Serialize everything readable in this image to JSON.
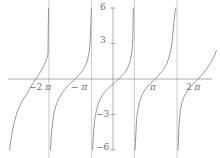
{
  "chart_data": {
    "type": "line",
    "title": "",
    "subtitle": "",
    "xlabel": "",
    "ylabel": "",
    "function": "tan(x)",
    "xlim": [
      -7.6,
      7.6
    ],
    "ylim": [
      -6,
      6
    ],
    "grid": false,
    "legend": null,
    "x_ticks": [
      -6.2832,
      -3.1416,
      3.1416,
      6.2832
    ],
    "x_tick_labels": [
      "−2π",
      "−π",
      "π",
      "2π"
    ],
    "y_ticks": [
      6,
      3,
      -3,
      -6
    ],
    "y_tick_labels": [
      "6",
      "3",
      "−3",
      "−6"
    ],
    "asymptotes": [
      -4.7124,
      -1.5708,
      1.5708,
      4.7124
    ],
    "branch_centers": [
      -6.2832,
      -3.1416,
      0,
      3.1416,
      6.2832
    ],
    "series": [
      {
        "name": "tan(x)",
        "color": "#8c8c8c",
        "branches": [
          {
            "center": -6.2832,
            "x": [
              -7.6,
              -7.5,
              -7.4,
              -7.3,
              -7.2,
              -7.1,
              -7.0,
              -6.9,
              -6.8,
              -6.7,
              -6.6,
              -6.5,
              -6.4,
              -6.2832,
              -6.15,
              -6.0,
              -5.85,
              -5.7,
              -5.55,
              -5.4,
              -5.25,
              -5.1,
              -4.95,
              -4.85,
              -4.78,
              -4.74
            ],
            "y": [
              -6.0,
              -5.1,
              -4.4,
              -3.83,
              -3.38,
              -3.0,
              -2.68,
              -2.4,
              -2.15,
              -1.93,
              -1.73,
              -1.54,
              -1.37,
              -1.14,
              -0.87,
              -0.58,
              -0.31,
              -0.05,
              0.21,
              0.48,
              0.77,
              1.09,
              1.46,
              1.78,
              2.12,
              6.0
            ]
          },
          {
            "center": -3.1416,
            "x": [
              -4.6,
              -4.55,
              -4.5,
              -4.42,
              -4.35,
              -4.25,
              -4.15,
              -4.05,
              -3.95,
              -3.85,
              -3.75,
              -3.65,
              -3.55,
              -3.45,
              -3.35,
              -3.25,
              -3.1416,
              -3.05,
              -2.95,
              -2.85,
              -2.75,
              -2.65,
              -2.55,
              -2.45,
              -2.35,
              -2.25,
              -2.15,
              -2.05,
              -1.95,
              -1.85,
              -1.75,
              -1.68,
              -1.62,
              -1.59
            ],
            "y": [
              -6.0,
              -5.0,
              -4.3,
              -3.5,
              -2.98,
              -2.47,
              -2.1,
              -1.82,
              -1.58,
              -1.38,
              -1.2,
              -1.04,
              -0.89,
              -0.75,
              -0.62,
              -0.49,
              -0.37,
              -0.28,
              -0.17,
              -0.06,
              0.06,
              0.17,
              0.29,
              0.41,
              0.55,
              0.7,
              0.87,
              1.08,
              1.35,
              1.73,
              2.3,
              3.1,
              4.8,
              6.0
            ]
          },
          {
            "center": 0,
            "x": [
              -1.5,
              -1.46,
              -1.42,
              -1.35,
              -1.28,
              -1.2,
              -1.1,
              -1.0,
              -0.9,
              -0.8,
              -0.7,
              -0.6,
              -0.5,
              -0.4,
              -0.3,
              -0.2,
              -0.1,
              0.0,
              0.1,
              0.2,
              0.3,
              0.4,
              0.5,
              0.6,
              0.7,
              0.8,
              0.9,
              1.0,
              1.1,
              1.2,
              1.28,
              1.35,
              1.42,
              1.46,
              1.5
            ],
            "y": [
              -6.0,
              -5.0,
              -4.3,
              -3.5,
              -2.98,
              -2.57,
              -2.13,
              -1.84,
              -1.6,
              -1.4,
              -1.23,
              -1.08,
              -0.95,
              -0.83,
              -0.72,
              -0.62,
              -0.52,
              -0.42,
              -0.32,
              -0.22,
              -0.12,
              -0.02,
              0.09,
              0.2,
              0.32,
              0.45,
              0.6,
              0.78,
              1.0,
              1.3,
              1.6,
              2.0,
              2.7,
              3.6,
              6.0
            ]
          },
          {
            "center": 3.1416,
            "x": [
              1.62,
              1.68,
              1.75,
              1.85,
              1.95,
              2.05,
              2.15,
              2.25,
              2.35,
              2.45,
              2.55,
              2.65,
              2.75,
              2.85,
              2.95,
              3.05,
              3.1416,
              3.25,
              3.35,
              3.45,
              3.55,
              3.65,
              3.75,
              3.85,
              3.95,
              4.05,
              4.15,
              4.25,
              4.35,
              4.45,
              4.55,
              4.62
            ],
            "y": [
              -6.0,
              -4.6,
              -3.2,
              -2.45,
              -1.95,
              -1.6,
              -1.32,
              -1.1,
              -0.92,
              -0.76,
              -0.62,
              -0.49,
              -0.37,
              -0.26,
              -0.15,
              -0.04,
              0.05,
              0.17,
              0.3,
              0.43,
              0.57,
              0.72,
              0.88,
              1.07,
              1.3,
              1.58,
              1.95,
              2.45,
              3.2,
              4.4,
              5.6,
              6.0
            ]
          },
          {
            "center": 6.2832,
            "x": [
              4.78,
              4.85,
              4.95,
              5.05,
              5.2,
              5.35,
              5.5,
              5.65,
              5.8,
              5.95,
              6.1,
              6.2832,
              6.4,
              6.55,
              6.7,
              6.85,
              7.0,
              7.15,
              7.3,
              7.45,
              7.6
            ],
            "y": [
              -6.0,
              -4.0,
              -2.6,
              -2.05,
              -1.55,
              -1.22,
              -0.96,
              -0.74,
              -0.54,
              -0.35,
              -0.17,
              0.02,
              0.18,
              0.38,
              0.58,
              0.8,
              1.04,
              1.3,
              1.6,
              1.95,
              2.4
            ]
          }
        ]
      }
    ]
  },
  "axes": {
    "x_axis_label_texts": [
      "−2π",
      "−π",
      "π",
      "2π"
    ],
    "y_axis_label_texts": [
      "6",
      "3",
      "−3",
      "−6"
    ],
    "axis_color": "#9a9a9a",
    "curve_color": "#8a8a8a",
    "asymptote_color": "#b4b4b4",
    "label_color": "#6f6f6f",
    "background": "#ffffff"
  },
  "labels": {
    "x": [
      {
        "name": "x-tick-minus-2pi",
        "sign": "−",
        "number": "2",
        "pi": "π",
        "left": 29,
        "top": 83
      },
      {
        "name": "x-tick-minus-pi",
        "sign": "−",
        "number": "",
        "pi": "π",
        "left": 71,
        "top": 83
      },
      {
        "name": "x-tick-pi",
        "sign": "",
        "number": "",
        "pi": "π",
        "left": 150,
        "top": 83
      },
      {
        "name": "x-tick-2pi",
        "sign": "",
        "number": "2",
        "pi": "π",
        "left": 186,
        "top": 83
      }
    ],
    "y": [
      {
        "name": "y-tick-6",
        "text": "6",
        "left": 100,
        "top": 3
      },
      {
        "name": "y-tick-3",
        "text": "3",
        "left": 100,
        "top": 36
      },
      {
        "name": "y-tick-neg-3",
        "text": "−3",
        "left": 96,
        "top": 110
      },
      {
        "name": "y-tick-neg-6",
        "text": "−6",
        "left": 96,
        "top": 143
      }
    ]
  }
}
